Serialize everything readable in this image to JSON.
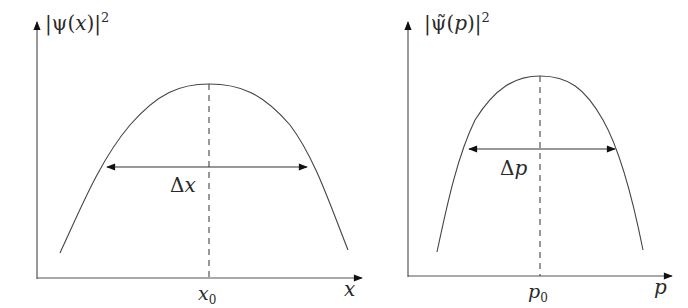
{
  "figure": {
    "left_panel": {
      "y_axis_label": {
        "prefix": "|ψ(",
        "var": "x",
        "suffix": ")|",
        "sup": "2"
      },
      "x_axis_label": "x",
      "center_tick": {
        "var": "x",
        "sub": "0"
      },
      "width_label": {
        "delta": "Δ",
        "var": "x"
      },
      "curve": "broad inverted bell",
      "center_line": "dashed vertical at x0"
    },
    "right_panel": {
      "y_axis_label": {
        "prefix": "|ψ̃(",
        "var": "p",
        "suffix": ")|",
        "sup": "2"
      },
      "x_axis_label": "p",
      "center_tick": {
        "var": "p",
        "sub": "0"
      },
      "width_label": {
        "delta": "Δ",
        "var": "p"
      },
      "curve": "narrower inverted bell",
      "center_line": "dashed vertical at p0"
    },
    "colors": {
      "line": "#3a3a3a",
      "arrow": "#111111",
      "text": "#2a2a2a"
    }
  }
}
